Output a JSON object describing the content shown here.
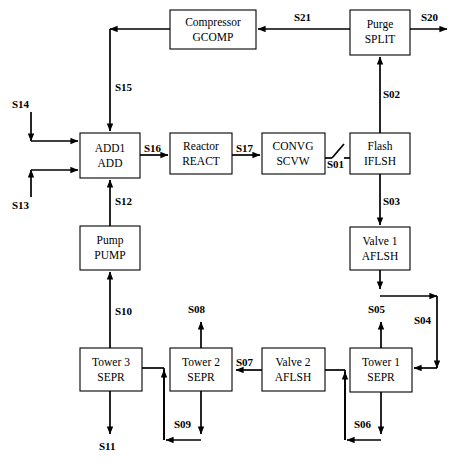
{
  "diagram": {
    "type": "process-flow-diagram",
    "colors": {
      "line": "#000000",
      "box_fill": "#ffffff",
      "box_stroke": "#000000",
      "background": "#ffffff"
    },
    "units": [
      {
        "id": "GCOMP",
        "name": "Compressor",
        "code": "GCOMP",
        "x": 170,
        "y": 10,
        "w": 86,
        "h": 39
      },
      {
        "id": "SPLIT",
        "name": "Purge",
        "code": "SPLIT",
        "x": 350,
        "y": 10,
        "w": 60,
        "h": 45
      },
      {
        "id": "ADD",
        "name": "ADD1",
        "code": "ADD",
        "x": 80,
        "y": 133,
        "w": 60,
        "h": 45
      },
      {
        "id": "REACT",
        "name": "Reactor",
        "code": "REACT",
        "x": 170,
        "y": 133,
        "w": 62,
        "h": 41
      },
      {
        "id": "SCVW",
        "name": "CONVG",
        "code": "SCVW",
        "x": 262,
        "y": 133,
        "w": 63,
        "h": 41
      },
      {
        "id": "IFLSH",
        "name": "Flash",
        "code": "IFLSH",
        "x": 350,
        "y": 133,
        "w": 60,
        "h": 41
      },
      {
        "id": "PUMP",
        "name": "Pump",
        "code": "PUMP",
        "x": 80,
        "y": 226,
        "w": 60,
        "h": 44
      },
      {
        "id": "AFLSH1",
        "name": "Valve 1",
        "code": "AFLSH",
        "x": 350,
        "y": 227,
        "w": 60,
        "h": 43
      },
      {
        "id": "SEPR3",
        "name": "Tower 3",
        "code": "SEPR",
        "x": 80,
        "y": 348,
        "w": 62,
        "h": 43
      },
      {
        "id": "SEPR2",
        "name": "Tower 2",
        "code": "SEPR",
        "x": 170,
        "y": 348,
        "w": 62,
        "h": 43
      },
      {
        "id": "AFLSH2",
        "name": "Valve 2",
        "code": "AFLSH",
        "x": 262,
        "y": 348,
        "w": 63,
        "h": 43
      },
      {
        "id": "SEPR1",
        "name": "Tower 1",
        "code": "SEPR",
        "x": 350,
        "y": 348,
        "w": 62,
        "h": 44
      }
    ],
    "streams": [
      {
        "id": "S20",
        "label": "S20",
        "lx": 421,
        "ly": 21,
        "from": "SPLIT",
        "to": "environment"
      },
      {
        "id": "S21",
        "label": "S21",
        "lx": 294,
        "ly": 21,
        "from": "SPLIT",
        "to": "GCOMP"
      },
      {
        "id": "S15",
        "label": "S15",
        "lx": 115,
        "ly": 91,
        "from": "GCOMP",
        "to": "ADD"
      },
      {
        "id": "S02",
        "label": "S02",
        "lx": 383,
        "ly": 98,
        "from": "IFLSH",
        "to": "SPLIT"
      },
      {
        "id": "S14",
        "label": "S14",
        "lx": 12,
        "ly": 108,
        "from": "feed",
        "to": "ADD"
      },
      {
        "id": "S13",
        "label": "S13",
        "lx": 12,
        "ly": 204,
        "from": "feed",
        "to": "ADD"
      },
      {
        "id": "S16",
        "label": "S16",
        "lx": 144,
        "ly": 152,
        "from": "ADD",
        "to": "REACT"
      },
      {
        "id": "S17",
        "label": "S17",
        "lx": 236,
        "ly": 152,
        "from": "REACT",
        "to": "SCVW"
      },
      {
        "id": "S01",
        "label": "S01",
        "lx": 327,
        "ly": 165,
        "from": "SCVW",
        "to": "IFLSH"
      },
      {
        "id": "S03",
        "label": "S03",
        "lx": 383,
        "ly": 202,
        "from": "IFLSH",
        "to": "AFLSH1"
      },
      {
        "id": "S12",
        "label": "S12",
        "lx": 113,
        "ly": 204,
        "from": "PUMP",
        "to": "ADD"
      },
      {
        "id": "S10",
        "label": "S10",
        "lx": 113,
        "ly": 312,
        "from": "SEPR3",
        "to": "PUMP"
      },
      {
        "id": "S08",
        "label": "S08",
        "lx": 196,
        "ly": 312,
        "from": "SEPR2",
        "to": "product"
      },
      {
        "id": "S05",
        "label": "S05",
        "lx": 381,
        "ly": 312,
        "from": "SEPR1",
        "to": "product"
      },
      {
        "id": "S04",
        "label": "S04",
        "lx": 417,
        "ly": 322,
        "from": "AFLSH1",
        "to": "SEPR1"
      },
      {
        "id": "S07",
        "label": "S07",
        "lx": 238,
        "ly": 363,
        "from": "AFLSH2",
        "to": "SEPR2"
      },
      {
        "id": "S09",
        "label": "S09",
        "lx": 177,
        "ly": 426,
        "from": "SEPR2",
        "to": "SEPR3-line"
      },
      {
        "id": "S06",
        "label": "S06",
        "lx": 358,
        "ly": 426,
        "from": "SEPR1",
        "to": "AFLSH2-line"
      },
      {
        "id": "S11",
        "label": "S11",
        "lx": 100,
        "ly": 446,
        "from": "SEPR3",
        "to": "product"
      }
    ]
  }
}
